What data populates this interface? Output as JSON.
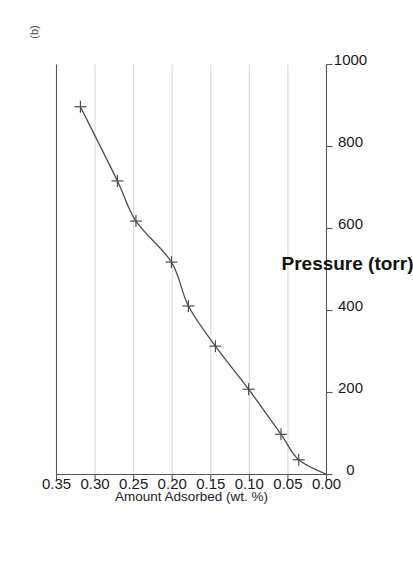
{
  "figure": {
    "panel_label": "(b)",
    "background_color": "#ffffff",
    "orientation": "rotated-90-ccw"
  },
  "chart_data": {
    "type": "line",
    "title": "",
    "subtitle": "",
    "xlabel": "Pressure (torr)",
    "ylabel": "Amount Adsorbed (wt. %)",
    "xlim": [
      0,
      1000
    ],
    "ylim": [
      0.0,
      0.35
    ],
    "xticks": [
      0,
      200,
      400,
      600,
      800,
      1000
    ],
    "xtick_labels": [
      "0",
      "200",
      "400",
      "600",
      "800",
      "1000"
    ],
    "yticks": [
      0.0,
      0.05,
      0.1,
      0.15,
      0.2,
      0.25,
      0.3,
      0.35
    ],
    "ytick_labels": [
      "0.00",
      "0.05",
      "0.10",
      "0.15",
      "0.20",
      "0.25",
      "0.30",
      "0.35"
    ],
    "grid": "y-gridlines-only",
    "legend": "none",
    "marker": "plus",
    "line_color": "#4d4d4d",
    "grid_color": "#c9c9c9",
    "axis_color": "#555555",
    "series": [
      {
        "name": "adsorption isotherm",
        "x": [
          0,
          36,
          98,
          208,
          313,
          411,
          518,
          618,
          716,
          897
        ],
        "y": [
          0.0,
          0.036,
          0.059,
          0.101,
          0.144,
          0.179,
          0.201,
          0.247,
          0.271,
          0.319
        ],
        "markers_at": [
          36,
          98,
          208,
          313,
          411,
          518,
          618,
          716,
          897
        ]
      }
    ]
  }
}
